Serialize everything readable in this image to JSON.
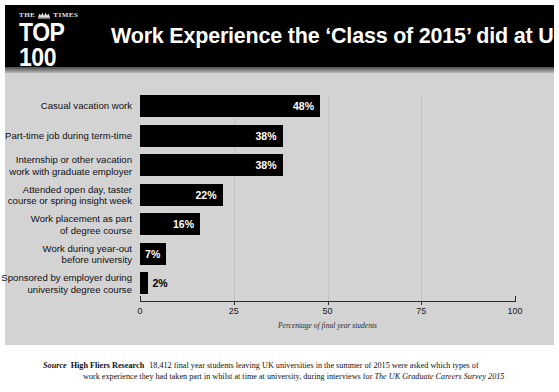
{
  "header": {
    "logo_masthead": "THE",
    "logo_masthead_2": "TIMES",
    "logo_crest": "crest-icon",
    "logo_rank": "TOP 100",
    "logo_subtitle": "GRADUATE EMPLOYERS",
    "title": "Work Experience the ‘Class of 2015’ did at University"
  },
  "footer": {
    "source_label": "Source",
    "source_org": "High Fliers Research",
    "line1": "18,412 final year students leaving UK universities in the summer of 2015 were asked which types of",
    "line2_pre": "work experience they had taken part in whilst at time at university, during interviews for ",
    "line2_italic": "The UK Graduate Careers Survey 2015"
  },
  "colors": {
    "bar": "#000000",
    "plot_background": "#d3d3d3",
    "header_background": "#000000",
    "gridline": "#c2c2c2",
    "axis": "#2b2b2b",
    "page": "#ffffff"
  },
  "chart_data": {
    "type": "bar",
    "orientation": "horizontal",
    "title": "Work Experience the ‘Class of 2015’ did at University",
    "subtitle": "",
    "xlabel": "Percentage of final year students",
    "ylabel": "",
    "xlim": [
      0,
      100
    ],
    "xticks": [
      0,
      25,
      50,
      75,
      100
    ],
    "xtick_labels": [
      "0",
      "25",
      "50",
      "75",
      "100"
    ],
    "grid": true,
    "grid_axis": "x",
    "legend": false,
    "value_suffix": "%",
    "categories": [
      "Casual vacation work",
      "Part-time job during term-time",
      "Internship or other vacation\nwork with graduate employer",
      "Attended open day, taster\ncourse or spring insight week",
      "Work placement as part\nof degree course",
      "Work during year-out\nbefore university",
      "Sponsored by employer during\nuniversity degree course"
    ],
    "values": [
      48,
      38,
      38,
      22,
      16,
      7,
      2
    ],
    "value_labels": [
      "48%",
      "38%",
      "38%",
      "22%",
      "16%",
      "7%",
      "2%"
    ],
    "label_placement": [
      "inside",
      "inside",
      "inside",
      "inside",
      "inside",
      "inside",
      "outside"
    ]
  }
}
